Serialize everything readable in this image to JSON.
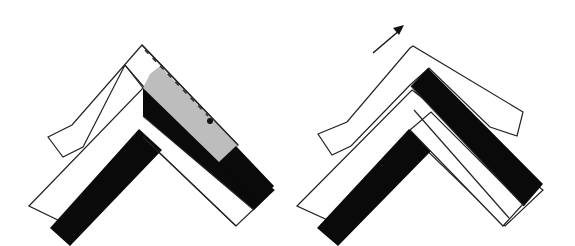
{
  "figure": {
    "panels": [
      {
        "id": "left",
        "description": "Folded chevron of two layered bands; top band shown with a grey shaded area, dashed fold line and a dot marker",
        "elements": [
          "white-outer-band",
          "black-inner-band",
          "top-folded-sheet",
          "grey-shaded-region",
          "dashed-line",
          "dot-marker"
        ]
      },
      {
        "id": "right",
        "description": "Same chevron after the top sheet is shifted up-right (arrow), revealing black band on right arm",
        "elements": [
          "white-outer-band",
          "black-inner-band",
          "top-folded-sheet",
          "direction-arrow"
        ]
      }
    ],
    "colors": {
      "outline": "#222222",
      "black_band": "#0a0a0a",
      "grey_region": "#bdbdbd",
      "background": "#ffffff"
    }
  }
}
